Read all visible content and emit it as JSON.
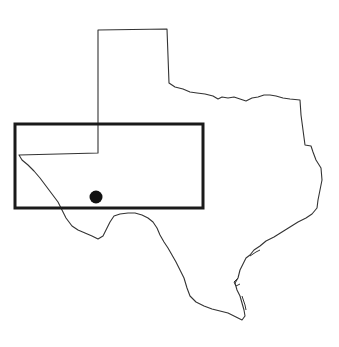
{
  "map": {
    "region": "Texas",
    "background_color": "#ffffff",
    "outline_color": "#333333",
    "highlight_box": {
      "x": 15,
      "y": 124,
      "width": 188,
      "height": 84,
      "stroke_color": "#1a1a1a",
      "stroke_width": 3
    },
    "location_marker": {
      "cx": 96,
      "cy": 197,
      "r": 6.5,
      "fill_color": "#111111"
    }
  }
}
